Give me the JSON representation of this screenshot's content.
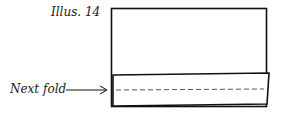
{
  "illustration": {
    "title": "Illus. 14",
    "callout_label": "Next fold",
    "callout_icon": "arrow-right-icon",
    "line_color": "#111111",
    "dash_color": "#555555"
  }
}
